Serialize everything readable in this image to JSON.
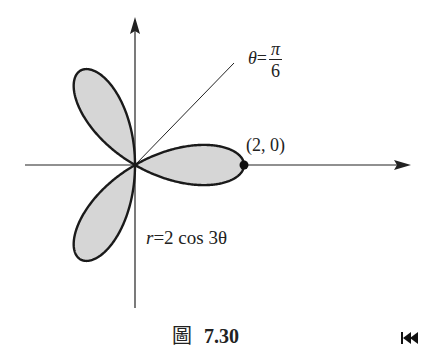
{
  "figure": {
    "caption_char": "圖",
    "caption_number": "7.30",
    "curve_label_r": "r",
    "curve_label_rest": "=2 cos 3θ",
    "ray_label_theta": "θ",
    "ray_label_eq": "=",
    "ray_label_num": "π",
    "ray_label_den": "6",
    "point_label": "(2, 0)",
    "nav_icon": "skip-back-icon"
  },
  "colors": {
    "fill": "#d6d6d6",
    "stroke": "#1a1a1a",
    "axis": "#222222"
  },
  "chart_data": {
    "type": "polar-curve",
    "equation": "r = 2 cos 3θ",
    "petals": 3,
    "petal_angles_deg": [
      0,
      120,
      240
    ],
    "max_r": 2,
    "marked_point": {
      "label": "(2, 0)",
      "x": 2,
      "y": 0
    },
    "ray": {
      "label": "θ = π/6",
      "angle_deg": 30
    },
    "axes": {
      "x_arrow": true,
      "y_arrow": true
    }
  }
}
